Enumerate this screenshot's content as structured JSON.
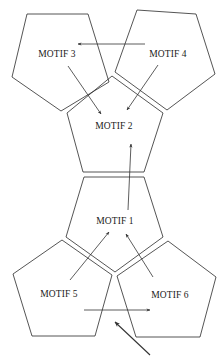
{
  "diagram": {
    "type": "pentagon motif network",
    "motifs": [
      {
        "id": "motif-1",
        "label": "MOTIF 1",
        "points": "84,177 144,177 163,237 115,272 66,237",
        "label_pos": [
          115,
          222
        ]
      },
      {
        "id": "motif-2",
        "label": "MOTIF 2",
        "points": "112,76 163,113 144,172 83,172 67,113",
        "label_pos": [
          114,
          127
        ]
      },
      {
        "id": "motif-3",
        "label": "MOTIF 3",
        "points": "27,14 88,14 109,82 61,111 12,77",
        "label_pos": [
          57,
          55
        ]
      },
      {
        "id": "motif-4",
        "label": "MOTIF 4",
        "points": "137,10 196,14 215,74 167,110 115,72",
        "label_pos": [
          168,
          55
        ]
      },
      {
        "id": "motif-5",
        "label": "MOTIF 5",
        "points": "62,240 112,275 95,336 32,336 13,274",
        "label_pos": [
          59,
          295
        ]
      },
      {
        "id": "motif-6",
        "label": "MOTIF 6",
        "points": "168,241 216,277 200,337 136,337 117,276",
        "label_pos": [
          170,
          296
        ]
      }
    ],
    "arrows": [
      {
        "id": "arrow-m4-to-m3",
        "from": "MOTIF 4",
        "to": "MOTIF 3",
        "x1": 145,
        "y1": 44,
        "x2": 78,
        "y2": 44
      },
      {
        "id": "arrow-m3-to-m2",
        "from": "MOTIF 3",
        "to": "MOTIF 2",
        "x1": 68,
        "y1": 66,
        "x2": 101,
        "y2": 114
      },
      {
        "id": "arrow-m4-to-m2",
        "from": "MOTIF 4",
        "to": "MOTIF 2",
        "x1": 158,
        "y1": 65,
        "x2": 127,
        "y2": 110
      },
      {
        "id": "arrow-m1-to-m2",
        "from": "MOTIF 1",
        "to": "MOTIF 2",
        "x1": 128,
        "y1": 210,
        "x2": 131,
        "y2": 144
      },
      {
        "id": "arrow-m5-to-m1",
        "from": "MOTIF 5",
        "to": "MOTIF 1",
        "x1": 70,
        "y1": 280,
        "x2": 109,
        "y2": 232
      },
      {
        "id": "arrow-m6-to-m1",
        "from": "MOTIF 6",
        "to": "MOTIF 1",
        "x1": 153,
        "y1": 277,
        "x2": 126,
        "y2": 234
      },
      {
        "id": "arrow-m5-to-m6",
        "from": "MOTIF 5",
        "to": "MOTIF 6",
        "x1": 84,
        "y1": 310,
        "x2": 150,
        "y2": 310
      },
      {
        "id": "arrow-external-in",
        "from": "external",
        "to": "junction",
        "x1": 150,
        "y1": 355,
        "x2": 115,
        "y2": 322
      }
    ],
    "separators": [
      {
        "id": "sep-m3-m2",
        "x1": 68,
        "y1": 112,
        "x2": 110,
        "y2": 78
      },
      {
        "id": "sep-m4-m2",
        "x1": 114,
        "y1": 78,
        "x2": 164,
        "y2": 112
      },
      {
        "id": "sep-m3-m4",
        "x1": 110,
        "y1": 75,
        "x2": 113,
        "y2": 75
      },
      {
        "id": "sep-m1-m2",
        "x1": 83,
        "y1": 175,
        "x2": 144,
        "y2": 175
      },
      {
        "id": "sep-m5-m1",
        "x1": 64,
        "y1": 238,
        "x2": 114,
        "y2": 274
      },
      {
        "id": "sep-m6-m1",
        "x1": 116,
        "y1": 274,
        "x2": 165,
        "y2": 239
      }
    ],
    "colors": {
      "stroke": "#2a2a2a",
      "arrow": "#333333",
      "text": "#1a1a1a",
      "background": "#ffffff"
    }
  }
}
